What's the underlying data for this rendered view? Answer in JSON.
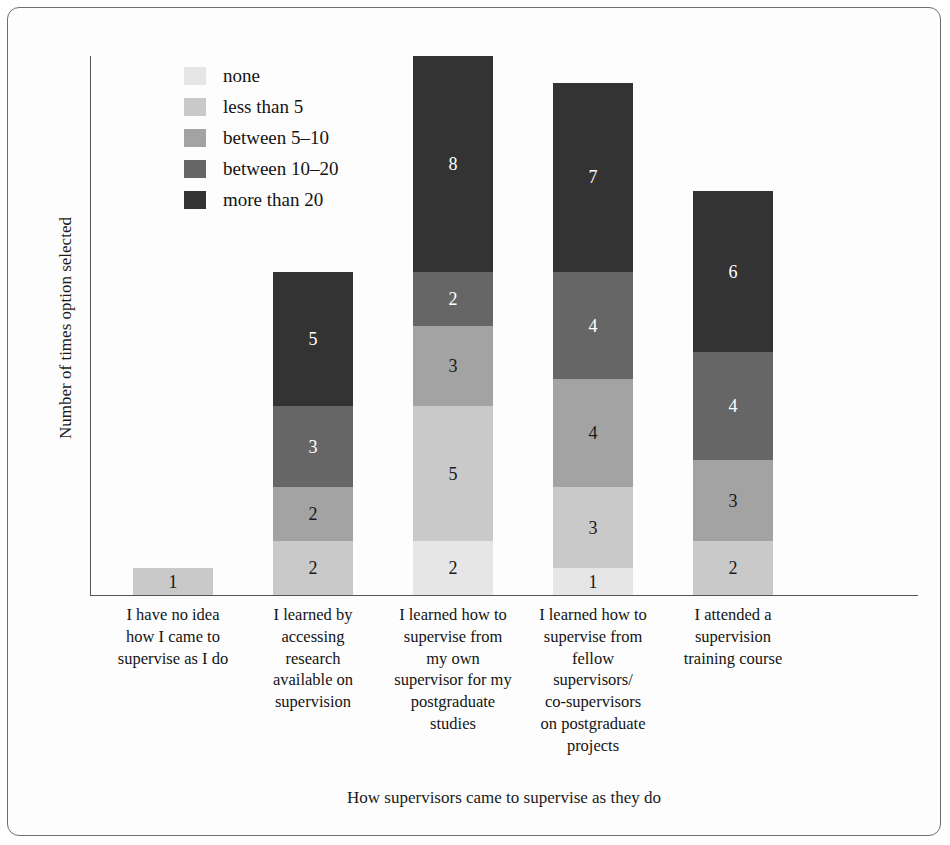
{
  "chart_data": {
    "type": "bar",
    "subtype": "stacked-bar",
    "title": "",
    "xlabel": "How supervisors came to supervise as they do",
    "ylabel": "Number of times option selected",
    "grid": false,
    "legend_position": "top-left",
    "ylim": [
      0,
      20
    ],
    "categories": [
      "I have no idea how I came to supervise as I do",
      "I learned by accessing research available on supervision",
      "I learned how to supervise from my own supervisor for my postgraduate studies",
      "I learned how to supervise from fellow supervisors/ co-supervisors on postgraduate projects",
      "I attended a supervision training course"
    ],
    "category_lines": [
      [
        "I have no idea",
        "how I came to",
        "supervise as I do"
      ],
      [
        "I learned by",
        "accessing",
        "research",
        "available on",
        "supervision"
      ],
      [
        "I learned how to",
        "supervise from",
        "my own",
        "supervisor for my",
        "postgraduate",
        "studies"
      ],
      [
        "I learned how to",
        "supervise from",
        "fellow",
        "supervisors/",
        "co-supervisors",
        "on postgraduate",
        "projects"
      ],
      [
        "I attended a",
        "supervision",
        "training course"
      ]
    ],
    "series": [
      {
        "name": "none",
        "color": "#e6e6e6",
        "text_color": "#1a1a1a",
        "values": [
          0,
          0,
          2,
          1,
          0
        ]
      },
      {
        "name": "less than 5",
        "color": "#c9c9c9",
        "text_color": "#1a1a1a",
        "values": [
          1,
          2,
          5,
          3,
          2
        ]
      },
      {
        "name": "between 5–10",
        "color": "#a3a3a3",
        "text_color": "#1a1a1a",
        "values": [
          0,
          2,
          3,
          4,
          3
        ]
      },
      {
        "name": "between 10–20",
        "color": "#666666",
        "text_color": "#ffffff",
        "values": [
          0,
          3,
          2,
          4,
          4
        ]
      },
      {
        "name": "more than 20",
        "color": "#333333",
        "text_color": "#ffffff",
        "values": [
          0,
          5,
          8,
          7,
          6
        ]
      }
    ],
    "totals": [
      1,
      12,
      20,
      19,
      15
    ]
  },
  "legend": {
    "items": [
      {
        "label": "none",
        "color": "#e6e6e6"
      },
      {
        "label": "less than 5",
        "color": "#c9c9c9"
      },
      {
        "label": "between 5–10",
        "color": "#a3a3a3"
      },
      {
        "label": "between 10–20",
        "color": "#666666"
      },
      {
        "label": "more than 20",
        "color": "#333333"
      }
    ]
  }
}
